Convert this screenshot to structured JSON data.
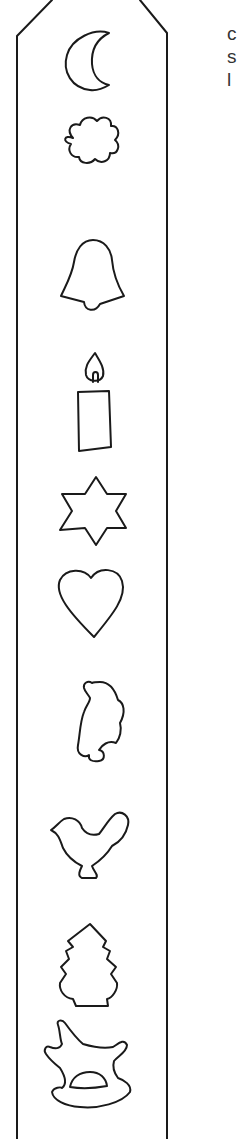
{
  "page": {
    "stroke_color": "#1a1a1a",
    "background": "#ffffff"
  },
  "side_text": {
    "line1": "c",
    "line2": "s",
    "line3": "l"
  },
  "strip": {
    "shapes": [
      {
        "name": "crescent-moon",
        "cy": 65
      },
      {
        "name": "cloud",
        "cy": 163
      },
      {
        "name": "bell",
        "cy": 268
      },
      {
        "name": "candle",
        "cy": 418
      },
      {
        "name": "six-point-star",
        "cy": 518
      },
      {
        "name": "heart",
        "cy": 604
      },
      {
        "name": "angel",
        "cy": 705
      },
      {
        "name": "bird",
        "cy": 842
      },
      {
        "name": "fir-tree",
        "cy": 974
      },
      {
        "name": "rocking-horse",
        "cy": 1083
      }
    ]
  }
}
